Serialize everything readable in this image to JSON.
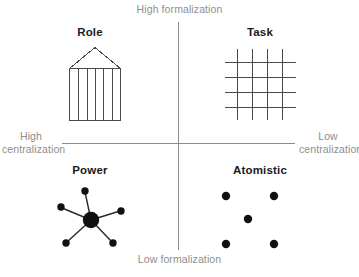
{
  "diagram": {
    "type": "2x2-matrix",
    "width": 359,
    "height": 277,
    "background_color": "#ffffff",
    "axis_color": "#8c8c8c",
    "axis_label_color": "#8e8e8e",
    "title_color": "#1a1a1a",
    "glyph_color": "#111111"
  },
  "axes": {
    "top_label": "High formalization",
    "bottom_label": "Low formalization",
    "left_label": "High centralization",
    "right_label": "Low centralization",
    "vertical_axis_name": "formalization",
    "horizontal_axis_name": "centralization"
  },
  "quadrants": [
    {
      "id": "role",
      "title": "Role",
      "position": "top-left",
      "formalization": "High formalization",
      "centralization": "High centralization",
      "icon": "temple-columns-icon",
      "icon_description": "Greek temple: triangular pediment over a rectangle divided by four vertical lines into five columns"
    },
    {
      "id": "task",
      "title": "Task",
      "position": "top-right",
      "formalization": "High formalization",
      "centralization": "Low centralization",
      "icon": "grid-net-icon",
      "icon_description": "Lattice grid of four vertical and four horizontal crossing lines"
    },
    {
      "id": "power",
      "title": "Power",
      "position": "bottom-left",
      "formalization": "Low formalization",
      "centralization": "High centralization",
      "icon": "hub-spoke-icon",
      "icon_description": "Large central node linked by six spokes to six small satellite nodes"
    },
    {
      "id": "atomistic",
      "title": "Atomistic",
      "position": "bottom-right",
      "formalization": "Low formalization",
      "centralization": "Low centralization",
      "icon": "scattered-dots-icon",
      "icon_description": "Five unconnected dots: four at the corners and one in the middle"
    }
  ]
}
